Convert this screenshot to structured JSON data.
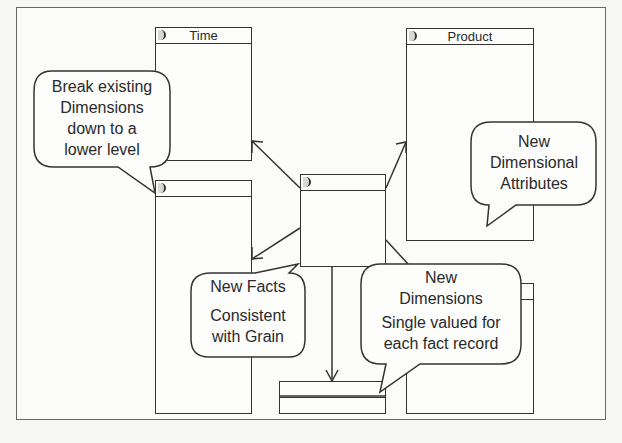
{
  "diagram": {
    "type": "star-schema-extension",
    "tables": {
      "time": {
        "title": "Time"
      },
      "product": {
        "title": "Product"
      },
      "fact": {
        "title": ""
      },
      "lower_left": {
        "title": ""
      },
      "lower_right": {
        "title": ""
      },
      "bottom_small": {
        "title": ""
      }
    },
    "callouts": {
      "break_existing": {
        "lines": [
          "Break existing",
          "Dimensions",
          "down to a",
          "lower level"
        ]
      },
      "new_attributes": {
        "lines": [
          "New",
          "Dimensional",
          "Attributes"
        ]
      },
      "new_facts": {
        "title": "New Facts",
        "lines": [
          "Consistent",
          "with Grain"
        ]
      },
      "new_dimensions": {
        "title_lines": [
          "New",
          "Dimensions"
        ],
        "lines": [
          "Single valued for",
          "each fact record"
        ]
      }
    },
    "colors": {
      "stroke": "#333333",
      "background": "#fbfbf9",
      "frame": "#666666"
    }
  }
}
